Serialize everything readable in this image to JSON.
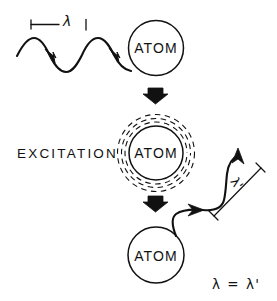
{
  "figure": {
    "background_color": "#ffffff",
    "ink_color": "#111111",
    "width": 277,
    "height": 301
  },
  "stages": {
    "incident": {
      "atom_label": "ATOM",
      "wavelength_label": "λ",
      "wave_direction": "left-to-right",
      "arrow_count": 2
    },
    "excitation": {
      "stage_label": "EXCITATION",
      "atom_label": "ATOM",
      "dashed_ring_count": 3
    },
    "emission": {
      "atom_label": "ATOM",
      "wavelength_label": "λ'",
      "wave_direction": "up-and-to-the-right",
      "arrow_count": 2
    }
  },
  "transitions": {
    "arrow_one": "down-arrow",
    "arrow_two": "down-arrow"
  },
  "conclusion": {
    "text": "λ = λ'"
  }
}
